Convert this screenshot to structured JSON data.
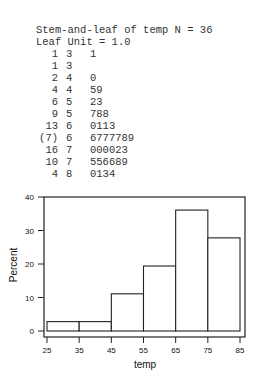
{
  "stem_and_leaf": {
    "title": "Stem-and-leaf of temp N = 36",
    "leaf_unit": "Leaf Unit = 1.0",
    "rows": [
      {
        "depth": "1",
        "stem": "3",
        "leaves": "1"
      },
      {
        "depth": "1",
        "stem": "3",
        "leaves": ""
      },
      {
        "depth": "2",
        "stem": "4",
        "leaves": "0"
      },
      {
        "depth": "4",
        "stem": "4",
        "leaves": "59"
      },
      {
        "depth": "6",
        "stem": "5",
        "leaves": "23"
      },
      {
        "depth": "9",
        "stem": "5",
        "leaves": "788"
      },
      {
        "depth": "13",
        "stem": "6",
        "leaves": "0113"
      },
      {
        "depth": "(7)",
        "stem": "6",
        "leaves": "6777789"
      },
      {
        "depth": "16",
        "stem": "7",
        "leaves": "000023"
      },
      {
        "depth": "10",
        "stem": "7",
        "leaves": "556689"
      },
      {
        "depth": "4",
        "stem": "8",
        "leaves": "0134"
      }
    ]
  },
  "chart_data": {
    "type": "bar",
    "title": "",
    "xlabel": "temp",
    "ylabel": "Percent",
    "bin_edges": [
      25,
      35,
      45,
      55,
      65,
      75,
      85
    ],
    "categories": [
      "25-35",
      "35-45",
      "45-55",
      "55-65",
      "65-75",
      "75-85"
    ],
    "values": [
      2.8,
      2.8,
      11.1,
      19.4,
      36.1,
      27.8
    ],
    "xticks": [
      "25",
      "35",
      "45",
      "55",
      "65",
      "75",
      "85"
    ],
    "yticks": [
      "0",
      "10",
      "20",
      "30",
      "40"
    ],
    "xlim": [
      25,
      85
    ],
    "ylim": [
      0,
      40
    ],
    "grid": false,
    "legend": null
  }
}
